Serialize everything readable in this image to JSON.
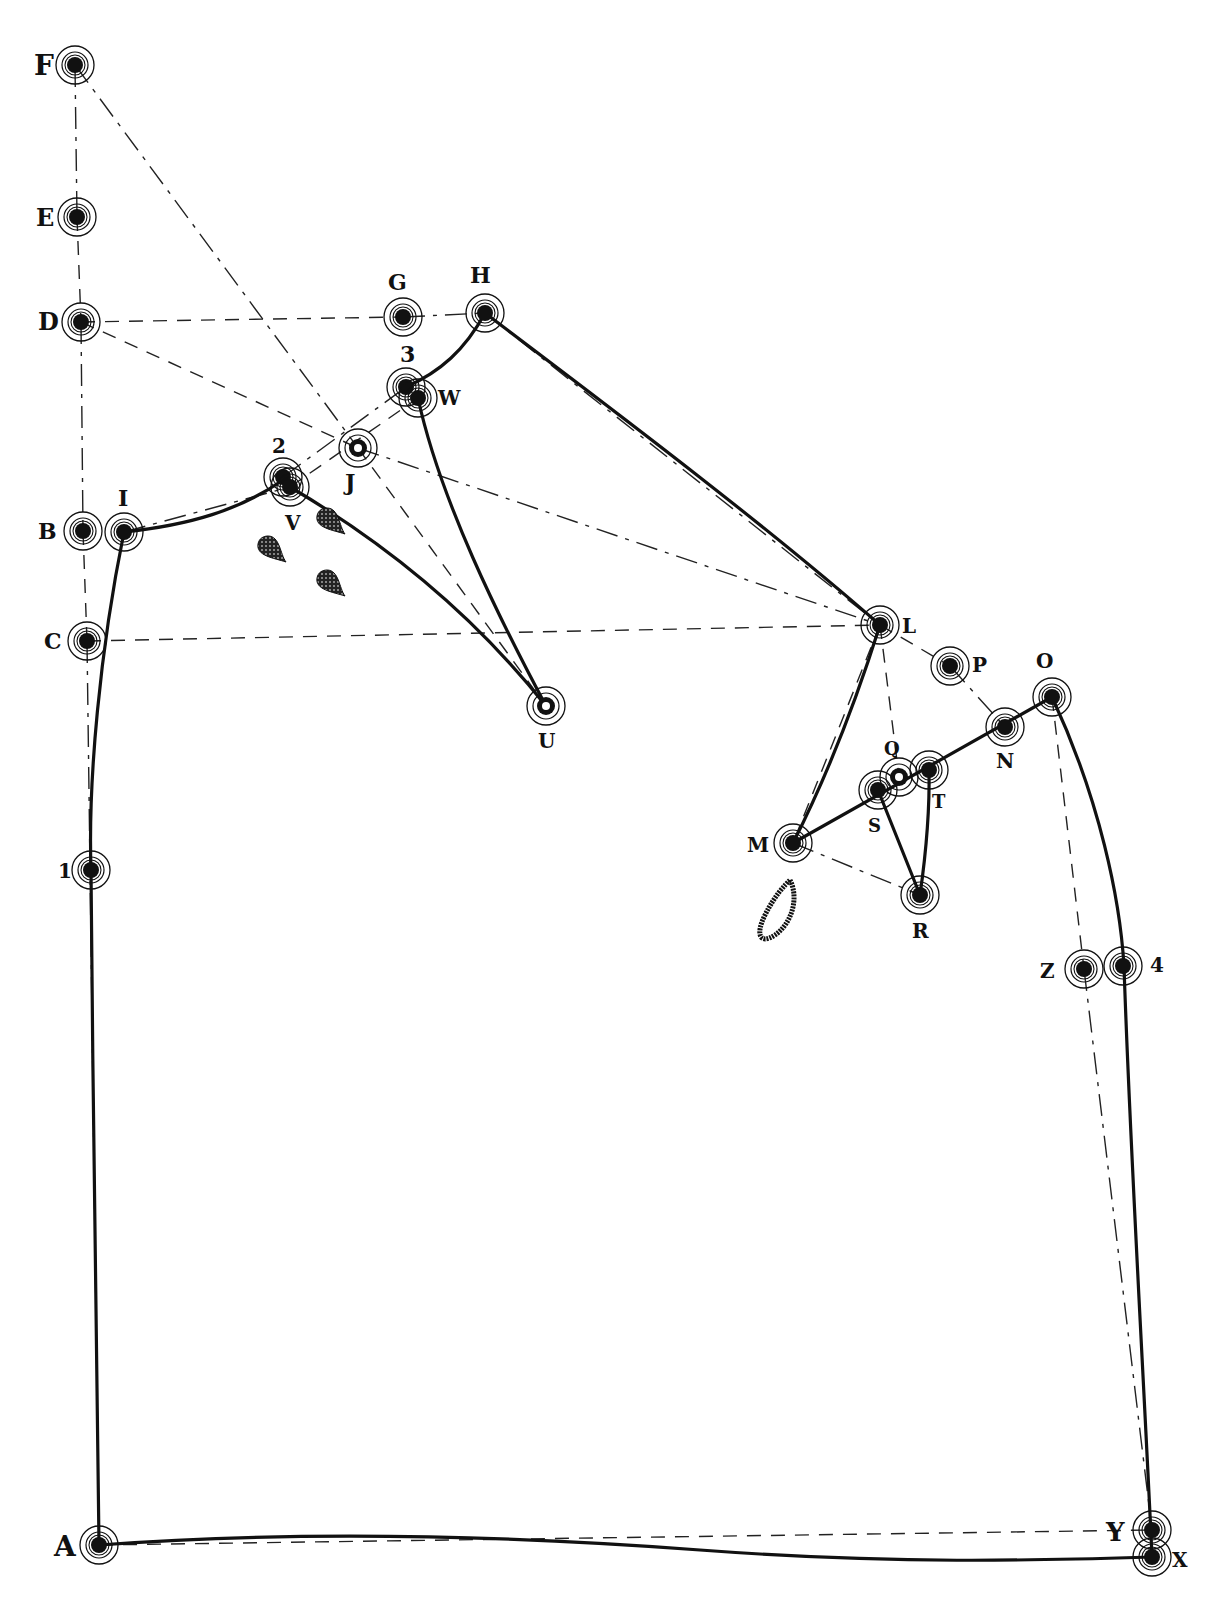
{
  "figure": {
    "type": "tailoring-pattern-draft",
    "colors": {
      "ink": "#111111",
      "paper": "#ffffff"
    }
  },
  "points": [
    {
      "id": "F",
      "label": "F",
      "x": 75,
      "y": 65,
      "lx": 34,
      "ly": 75,
      "size": 28
    },
    {
      "id": "E",
      "label": "E",
      "x": 77,
      "y": 217,
      "lx": 36,
      "ly": 226,
      "size": 24
    },
    {
      "id": "D",
      "label": "D",
      "x": 81,
      "y": 322,
      "lx": 38,
      "ly": 330,
      "size": 24
    },
    {
      "id": "G",
      "label": "G",
      "x": 403,
      "y": 317,
      "lx": 388,
      "ly": 290,
      "size": 22
    },
    {
      "id": "H",
      "label": "H",
      "x": 485,
      "y": 313,
      "lx": 470,
      "ly": 283,
      "size": 22
    },
    {
      "id": "3",
      "label": "3",
      "x": 406,
      "y": 387,
      "lx": 400,
      "ly": 362,
      "size": 22
    },
    {
      "id": "W",
      "label": "W",
      "x": 418,
      "y": 398,
      "lx": 438,
      "ly": 405,
      "size": 20
    },
    {
      "id": "J",
      "label": "J",
      "x": 358,
      "y": 448,
      "lx": 345,
      "ly": 490,
      "size": 22
    },
    {
      "id": "2",
      "label": "2",
      "x": 283,
      "y": 477,
      "lx": 272,
      "ly": 453,
      "size": 20
    },
    {
      "id": "V",
      "label": "V",
      "x": 290,
      "y": 487,
      "lx": 285,
      "ly": 530,
      "size": 20
    },
    {
      "id": "B",
      "label": "B",
      "x": 83,
      "y": 531,
      "lx": 38,
      "ly": 539,
      "size": 22
    },
    {
      "id": "I",
      "label": "I",
      "x": 124,
      "y": 532,
      "lx": 118,
      "ly": 506,
      "size": 22
    },
    {
      "id": "C",
      "label": "C",
      "x": 87,
      "y": 641,
      "lx": 44,
      "ly": 649,
      "size": 22
    },
    {
      "id": "U",
      "label": "U",
      "x": 546,
      "y": 706,
      "lx": 538,
      "ly": 748,
      "size": 20
    },
    {
      "id": "L",
      "label": "L",
      "x": 880,
      "y": 625,
      "lx": 902,
      "ly": 633,
      "size": 20
    },
    {
      "id": "P",
      "label": "P",
      "x": 950,
      "y": 666,
      "lx": 972,
      "ly": 672,
      "size": 20
    },
    {
      "id": "O",
      "label": "O",
      "x": 1052,
      "y": 697,
      "lx": 1036,
      "ly": 668,
      "size": 20
    },
    {
      "id": "N",
      "label": "N",
      "x": 1005,
      "y": 727,
      "lx": 996,
      "ly": 768,
      "size": 20
    },
    {
      "id": "Q",
      "label": "Q",
      "x": 899,
      "y": 777,
      "lx": 884,
      "ly": 755,
      "size": 18
    },
    {
      "id": "T",
      "label": "T",
      "x": 929,
      "y": 770,
      "lx": 932,
      "ly": 808,
      "size": 18
    },
    {
      "id": "S",
      "label": "S",
      "x": 878,
      "y": 790,
      "lx": 868,
      "ly": 832,
      "size": 18
    },
    {
      "id": "M",
      "label": "M",
      "x": 793,
      "y": 843,
      "lx": 747,
      "ly": 852,
      "size": 20
    },
    {
      "id": "R",
      "label": "R",
      "x": 920,
      "y": 895,
      "lx": 912,
      "ly": 938,
      "size": 20
    },
    {
      "id": "1",
      "label": "1",
      "x": 91,
      "y": 870,
      "lx": 58,
      "ly": 878,
      "size": 20
    },
    {
      "id": "Z",
      "label": "Z",
      "x": 1084,
      "y": 969,
      "lx": 1040,
      "ly": 978,
      "size": 20
    },
    {
      "id": "4",
      "label": "4",
      "x": 1123,
      "y": 966,
      "lx": 1150,
      "ly": 972,
      "size": 20
    },
    {
      "id": "A",
      "label": "A",
      "x": 99,
      "y": 1545,
      "lx": 54,
      "ly": 1556,
      "size": 28
    },
    {
      "id": "Y",
      "label": "Y",
      "x": 1152,
      "y": 1530,
      "lx": 1106,
      "ly": 1541,
      "size": 26
    },
    {
      "id": "X",
      "label": "X",
      "x": 1152,
      "y": 1557,
      "lx": 1172,
      "ly": 1567,
      "size": 20
    }
  ],
  "construction_lines": [
    [
      "F",
      "E"
    ],
    [
      "E",
      "D"
    ],
    [
      "D",
      "B"
    ],
    [
      "B",
      "C"
    ],
    [
      "C",
      "A"
    ],
    [
      "D",
      "G"
    ],
    [
      "G",
      "H"
    ],
    [
      "D",
      "J"
    ],
    [
      "F",
      "J"
    ],
    [
      "J",
      "U"
    ],
    [
      "J",
      "L"
    ],
    [
      "C",
      "L"
    ],
    [
      "H",
      "L"
    ],
    [
      "L",
      "P"
    ],
    [
      "P",
      "N"
    ],
    [
      "L",
      "Q"
    ],
    [
      "M",
      "R"
    ],
    [
      "O",
      "Z"
    ],
    [
      "Z",
      "Y"
    ],
    [
      "A",
      "Y"
    ],
    [
      "2",
      "3"
    ],
    [
      "V",
      "W"
    ],
    [
      "I",
      "V"
    ],
    [
      "L",
      "M"
    ]
  ],
  "seam_paths": [
    {
      "name": "neck-curve",
      "d": "M124,532 C190,525 240,510 283,480"
    },
    {
      "name": "gorge-3-H",
      "d": "M406,387 C440,372 465,350 485,313"
    },
    {
      "name": "dart-left",
      "d": "M290,487 C380,540 470,610 546,706"
    },
    {
      "name": "dart-right",
      "d": "M418,398 C440,500 500,620 546,706"
    },
    {
      "name": "shoulder",
      "d": "M485,313 C600,400 760,520 880,625"
    },
    {
      "name": "armhole-L-M",
      "d": "M880,625 C850,720 820,790 793,843"
    },
    {
      "name": "M-to-O",
      "d": "M793,843 L1052,697"
    },
    {
      "name": "dart-S-R",
      "d": "M878,790 L920,895"
    },
    {
      "name": "dart-T-R",
      "d": "M929,770 C930,820 925,860 920,895"
    },
    {
      "name": "side-seam",
      "d": "M1052,697 C1100,800 1120,900 1124,966 C1130,1150 1145,1400 1152,1557"
    },
    {
      "name": "hem",
      "d": "M99,1545 C300,1530 500,1535 700,1550 C900,1565 1050,1560 1152,1557"
    },
    {
      "name": "front-edge",
      "d": "M124,532 C100,650 88,780 91,870 C93,1100 96,1350 99,1545"
    }
  ],
  "marks": {
    "buttonholes": [
      {
        "x": 268,
        "y": 548
      },
      {
        "x": 327,
        "y": 520
      },
      {
        "x": 327,
        "y": 582
      }
    ],
    "pocket_loop": {
      "d": "M790,880 C800,900 790,925 775,935 C760,945 755,935 765,915 C775,895 785,885 790,880 Z"
    }
  }
}
